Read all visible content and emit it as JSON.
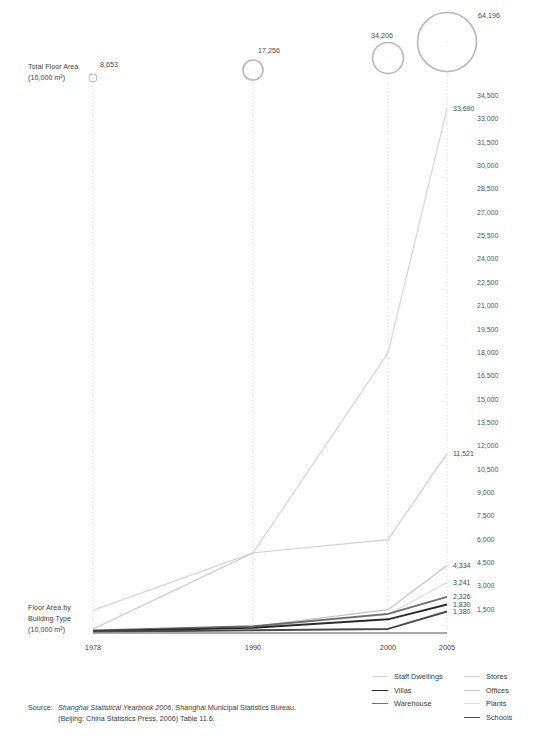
{
  "axis_left": {
    "top_label_line1": "Total Floor Area",
    "top_label_line2": "(10,000 m²)",
    "bottom_label_line1": "Floor Area by",
    "bottom_label_line2": "Building Type",
    "bottom_label_line3": "(10,000 m²)"
  },
  "source": {
    "prefix": "Source:",
    "line1_italic": "Shanghai Statistical Yearbook 2006",
    "line1_rest": ". Shanghai Municipal Statistics Bureau.",
    "line2": "(Beijing: China Statistics Press, 2006) Table 11.6."
  },
  "legend": {
    "column1": [
      {
        "label": "Staff Dwellings",
        "color": "#d6d6d6",
        "width": 1.2
      },
      {
        "label": "Villas",
        "color": "#2b2b2b",
        "width": 1.9
      },
      {
        "label": "Warehouse",
        "color": "#6e6e6e",
        "width": 1.9
      }
    ],
    "column2": [
      {
        "label": "Stores",
        "color": "#d0d0d0",
        "width": 1.2
      },
      {
        "label": "Offices",
        "color": "#c4c4c4",
        "width": 1.2
      },
      {
        "label": "Plants",
        "color": "#dcdcdc",
        "width": 1.2
      },
      {
        "label": "Schools",
        "color": "#4a4a4a",
        "width": 1.9
      }
    ]
  },
  "chart_data": {
    "type": "line",
    "title": "",
    "xlabel": "",
    "ylabel": "Floor Area by Building Type (10,000 m²)",
    "x": [
      "1978",
      "1990",
      "2000",
      "2005"
    ],
    "ylim": [
      0,
      34500
    ],
    "ytick_step": 1500,
    "yticks": [
      "34,500",
      "33,000",
      "31,500",
      "30,000",
      "28,500",
      "27,000",
      "25,500",
      "24,000",
      "22,500",
      "21,000",
      "19,500",
      "18,000",
      "16,500",
      "15,000",
      "13,500",
      "12,000",
      "10,500",
      "9,000",
      "7,500",
      "6,000",
      "4,500",
      "3,000",
      "1,500"
    ],
    "grid": "dotted-vertical",
    "legend_position": "bottom-right",
    "series": [
      {
        "name": "Staff Dwellings",
        "color": "#d6d6d6",
        "width": 1.2,
        "values": [
          1450,
          5150,
          18000,
          33690
        ],
        "end_label": "33,690"
      },
      {
        "name": "Stores",
        "color": "#d0d0d0",
        "width": 1.2,
        "values": [
          250,
          5150,
          6000,
          11521
        ],
        "end_label": "11,521"
      },
      {
        "name": "Offices",
        "color": "#c4c4c4",
        "width": 1.2,
        "values": [
          120,
          420,
          1500,
          4334
        ],
        "end_label": "4,334"
      },
      {
        "name": "Plants",
        "color": "#dcdcdc",
        "width": 1.2,
        "values": [
          150,
          380,
          1180,
          3241
        ],
        "end_label": "3,241"
      },
      {
        "name": "Warehouse",
        "color": "#6e6e6e",
        "width": 1.9,
        "values": [
          160,
          430,
          1230,
          2326
        ],
        "end_label": "2,326"
      },
      {
        "name": "Villas",
        "color": "#2b2b2b",
        "width": 1.9,
        "values": [
          110,
          330,
          880,
          1830
        ],
        "end_label": "1,830"
      },
      {
        "name": "Schools",
        "color": "#4a4a4a",
        "width": 1.9,
        "values": [
          80,
          180,
          260,
          1380
        ],
        "end_label": "1,380"
      }
    ],
    "bubbles": [
      {
        "x": "1978",
        "label": "8,653",
        "value": 8653,
        "r": 4.0
      },
      {
        "x": "1990",
        "label": "17,256",
        "value": 17256,
        "r": 10.0
      },
      {
        "x": "2000",
        "label": "34,206",
        "value": 34206,
        "r": 15.5
      },
      {
        "x": "2005",
        "label": "64,196",
        "value": 64196,
        "r": 29.5
      }
    ]
  }
}
